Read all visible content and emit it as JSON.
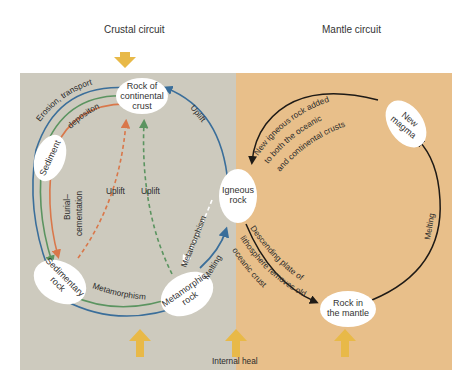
{
  "headers": {
    "crustal": "Crustal circuit",
    "mantle": "Mantle circuit"
  },
  "colors": {
    "crustal_bg": "#cdcabe",
    "mantle_bg": "#e8bf8a",
    "heat_arrow": "#e8b948",
    "blue": "#3a6e9a",
    "green": "#5b9460",
    "orange": "#d9774a",
    "black": "#1e1a16",
    "node_fill": "#ffffff"
  },
  "nodes": {
    "continental": [
      "Rock of",
      "continental",
      "crust"
    ],
    "sediment": "Sediment",
    "sedimentary": [
      "Sedimentary",
      "rock"
    ],
    "metamorphic": [
      "Metamorphic",
      "rock"
    ],
    "igneous": [
      "Igneous",
      "rock"
    ],
    "mantle_rock": [
      "Rock in",
      "the mantle"
    ],
    "new_magma": [
      "New",
      "magma"
    ]
  },
  "labels": {
    "erosion": "Erosion, transport",
    "deposition": "depositon",
    "burial": [
      "Burial–",
      "cementation"
    ],
    "uplift_orange": "Uplift",
    "uplift_green": "Uplift",
    "uplift_blue": "Uplift",
    "metamorphism_bottom": "Metamorphism",
    "metamorphism_diag": "Metamorphism",
    "melting_left": "Melting",
    "melting_right": "Melting",
    "new_igneous": [
      "New igneous rock added",
      "to both the oceanic",
      "and continental crusts"
    ],
    "descending": [
      "Descending plate of",
      "lithosphere removes old",
      "oceanic crust"
    ],
    "internal_heat": "Internal heal"
  }
}
